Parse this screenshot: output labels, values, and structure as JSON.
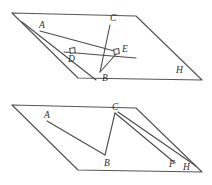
{
  "figure": {
    "stroke_color": "#4a4a4a",
    "plane_color": "#555555",
    "background": "#ffffff",
    "label_color": "#2e2e2e"
  },
  "upper_figure": {
    "name": "upper-plane-diagram",
    "plane": {
      "name": "parallelogram-plane-upper",
      "points": "12,13 136,16 202,80 78,78"
    },
    "segments": [
      {
        "name": "segment-a-to-e",
        "path": "M 40,31 L 118,52"
      },
      {
        "name": "segment-line-through-d",
        "path": "M 22,22 L 96,80"
      },
      {
        "name": "segment-c-to-b",
        "path": "M 110,25 L 100,72"
      },
      {
        "name": "segment-b-to-e",
        "path": "M 100,72 L 118,52"
      },
      {
        "name": "segment-horizontal-through-de",
        "path": "M 64,52 L 136,58"
      }
    ],
    "markers": [
      {
        "name": "right-angle-marker-d",
        "x": 70,
        "y": 48,
        "size": 5,
        "rotate": -8
      },
      {
        "name": "right-angle-marker-e",
        "x": 114,
        "y": 49,
        "size": 5,
        "rotate": -8
      }
    ],
    "labels": [
      {
        "name": "label-a-upper",
        "text": "A",
        "x": 39,
        "y": 28
      },
      {
        "name": "label-c-upper",
        "text": "C",
        "x": 110,
        "y": 21
      },
      {
        "name": "label-d-upper",
        "text": "D",
        "x": 68,
        "y": 62
      },
      {
        "name": "label-e-upper",
        "text": "E",
        "x": 122,
        "y": 52
      },
      {
        "name": "label-b-upper",
        "text": "B",
        "x": 102,
        "y": 81
      },
      {
        "name": "label-h-upper",
        "text": "H",
        "x": 176,
        "y": 73
      }
    ]
  },
  "lower_figure": {
    "name": "lower-plane-diagram",
    "plane": {
      "name": "parallelogram-plane-lower",
      "points": "12,105 136,108 202,172 78,170"
    },
    "segments": [
      {
        "name": "segment-a-to-b-lower",
        "path": "M 47,121 L 105,155"
      },
      {
        "name": "segment-b-to-c-lower",
        "path": "M 105,155 L 115,113"
      },
      {
        "name": "segment-c-to-f-lower",
        "path": "M 115,113 L 175,163"
      },
      {
        "name": "segment-c-to-h-lower",
        "path": "M 118,112 L 196,166"
      }
    ],
    "labels": [
      {
        "name": "label-a-lower",
        "text": "A",
        "x": 44,
        "y": 118
      },
      {
        "name": "label-c-lower",
        "text": "C",
        "x": 112,
        "y": 110
      },
      {
        "name": "label-b-lower",
        "text": "B",
        "x": 104,
        "y": 166
      },
      {
        "name": "label-f-lower",
        "text": "F",
        "x": 169,
        "y": 167
      },
      {
        "name": "label-h-lower",
        "text": "H",
        "x": 183,
        "y": 170
      }
    ]
  }
}
